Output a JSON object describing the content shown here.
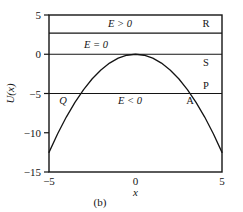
{
  "figure": {
    "caption": "(b)",
    "x_axis": {
      "label": "x",
      "ticks": [
        {
          "value": -5,
          "label": "−5"
        },
        {
          "value": 0,
          "label": "0"
        },
        {
          "value": 5,
          "label": "5"
        }
      ],
      "range": [
        -5,
        5
      ]
    },
    "y_axis": {
      "label": "U(x)",
      "ticks": [
        {
          "value": 5,
          "label": "5"
        },
        {
          "value": 0,
          "label": "0"
        },
        {
          "value": -5,
          "label": "−5"
        },
        {
          "value": -10,
          "label": "−10"
        },
        {
          "value": -15,
          "label": "−15"
        }
      ],
      "range": [
        -15,
        5
      ]
    }
  },
  "annotations": {
    "energy_positive": "E > 0",
    "energy_zero": "E = 0",
    "energy_negative": "E < 0",
    "point_R": "R",
    "point_S": "S",
    "point_P": "P",
    "point_A": "A",
    "point_Q": "Q"
  },
  "chart_data": {
    "type": "line",
    "title": "",
    "subtitle": "",
    "xlabel": "x",
    "ylabel": "U(x)",
    "xlim": [
      -5,
      5
    ],
    "ylim": [
      -15,
      5
    ],
    "grid": false,
    "legend": "none",
    "series": [
      {
        "name": "U(x) = -0.5 x^2",
        "type": "curve",
        "x": [
          -5,
          -4.5,
          -4,
          -3.5,
          -3,
          -2.5,
          -2,
          -1.5,
          -1,
          -0.5,
          0,
          0.5,
          1,
          1.5,
          2,
          2.5,
          3,
          3.5,
          4,
          4.5,
          5
        ],
        "y": [
          -12.5,
          -10.125,
          -8,
          -6.125,
          -4.5,
          -3.125,
          -2,
          -1.125,
          -0.5,
          -0.125,
          0,
          -0.125,
          -0.5,
          -1.125,
          -2,
          -3.125,
          -4.5,
          -6.125,
          -8,
          -10.125,
          -12.5
        ]
      },
      {
        "name": "E > 0 energy level",
        "type": "hline",
        "y": 2.7,
        "label": "E > 0"
      },
      {
        "name": "E = 0 energy level",
        "type": "hline",
        "y": 0,
        "label": "E = 0"
      },
      {
        "name": "E < 0 energy level",
        "type": "hline",
        "y": -5,
        "label": "E < 0"
      }
    ],
    "annotations": [
      {
        "text": "E > 0",
        "x": -0.9,
        "y": 3.9
      },
      {
        "text": "E = 0",
        "x": -2.3,
        "y": 1.35
      },
      {
        "text": "E < 0",
        "x": -0.3,
        "y": -5.9
      },
      {
        "text": "R",
        "x": 4.3,
        "y": 3.9
      },
      {
        "text": "S",
        "x": 4.3,
        "y": -0.95
      },
      {
        "text": "P",
        "x": 4.3,
        "y": -4.0
      },
      {
        "text": "A",
        "x": 3.15,
        "y": -5.9
      },
      {
        "text": "Q",
        "x": -3.85,
        "y": -5.9
      }
    ]
  }
}
